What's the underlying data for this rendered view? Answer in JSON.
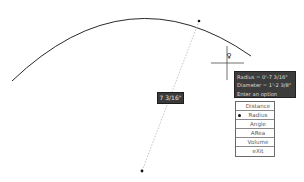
{
  "command": "MEASUREGEOM",
  "dimension_label": "7 3/16\"",
  "tooltip": {
    "lines": [
      "Radius = 0'-7 3/16\"",
      "Diameter = 1'-2 3/8\"",
      "Enter an option"
    ]
  },
  "menu": {
    "selected": "Radius",
    "items": [
      {
        "label": "Distance",
        "selected": false
      },
      {
        "label": "Radius",
        "selected": true
      },
      {
        "label": "Angle",
        "selected": false
      },
      {
        "label": "ARea",
        "selected": false
      },
      {
        "label": "Volume",
        "selected": false
      },
      {
        "label": "eXit",
        "selected": false
      }
    ]
  },
  "icons": {
    "cursor": "crosshair-icon",
    "pick": "pick-box-icon"
  },
  "colors": {
    "background": "#ffffff",
    "arc": "#2a2a2a",
    "tooltip_bg": "#3c3c3c",
    "menu_border": "#6a6a6a"
  }
}
